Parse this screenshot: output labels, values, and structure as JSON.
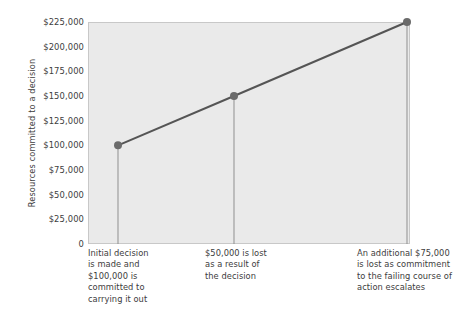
{
  "chart_data": {
    "type": "line",
    "title": "",
    "xlabel": "",
    "ylabel": "Resources committed to a decision",
    "ylim": [
      0,
      225000
    ],
    "grid": false,
    "legend": null,
    "x": [
      1,
      2,
      3
    ],
    "values": [
      100000,
      150000,
      225000
    ],
    "point_labels": [
      "$100,000",
      "$150,000",
      "$225,000"
    ],
    "ytick_labels": [
      "$225,000",
      "$200,000",
      "$175,000",
      "$150,000",
      "$125,000",
      "$100,000",
      "$75,000",
      "$50,000",
      "$25,000",
      "0"
    ],
    "ytick_values": [
      225000,
      200000,
      175000,
      150000,
      125000,
      100000,
      75000,
      50000,
      25000,
      0
    ],
    "annotations": [
      {
        "lines": [
          "Initial decision",
          "is made and",
          "$100,000 is",
          "committed to",
          "carrying it out"
        ]
      },
      {
        "lines": [
          "$50,000 is lost",
          "as a result of",
          "the decision"
        ]
      },
      {
        "lines": [
          "An additional $75,000",
          "is lost as commitment",
          "to the failing course of",
          "action escalates"
        ]
      }
    ],
    "colors": {
      "plot_background": "#eaeaea",
      "line": "#555555",
      "marker": "#6b6b6b",
      "drop_line": "#8f8f8f",
      "text": "#3d3d3d",
      "axis": "#c8c8c8"
    }
  }
}
